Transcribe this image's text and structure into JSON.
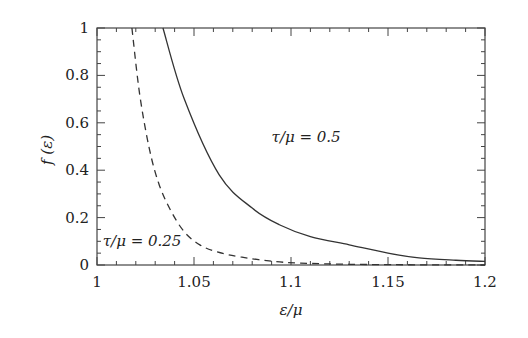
{
  "chart_data": {
    "type": "line",
    "title": "",
    "xlabel": "ε/μ",
    "ylabel": "f (ε)",
    "xlim": [
      1,
      1.2
    ],
    "ylim": [
      0,
      1
    ],
    "xticks": [
      1,
      1.05,
      1.1,
      1.15,
      1.2
    ],
    "xtick_labels": [
      "1",
      "1.05",
      "1.1",
      "1.15",
      "1.2"
    ],
    "yticks": [
      0,
      0.2,
      0.4,
      0.6,
      0.8,
      1
    ],
    "ytick_labels": [
      "0",
      "0.2",
      "0.4",
      "0.6",
      "0.8",
      "1"
    ],
    "grid": false,
    "legend": "none (inline annotations)",
    "series": [
      {
        "name": "τ/μ = 0.5",
        "style": "solid",
        "x": [
          1.034,
          1.045,
          1.063,
          1.08,
          1.094,
          1.11,
          1.13,
          1.15,
          1.166,
          1.185,
          1.2
        ],
        "y": [
          1.0,
          0.7,
          0.38,
          0.24,
          0.17,
          0.12,
          0.085,
          0.05,
          0.03,
          0.02,
          0.015
        ]
      },
      {
        "name": "τ/μ = 0.25",
        "style": "dashed",
        "x": [
          1.018,
          1.022,
          1.027,
          1.032,
          1.038,
          1.045,
          1.053,
          1.062,
          1.074,
          1.09,
          1.105,
          1.13,
          1.16,
          1.2
        ],
        "y": [
          1.0,
          0.72,
          0.49,
          0.34,
          0.23,
          0.14,
          0.085,
          0.055,
          0.034,
          0.016,
          0.008,
          0.003,
          0.001,
          0.0
        ]
      }
    ],
    "annotations": [
      {
        "text": "τ/μ = 0.5",
        "x": 1.09,
        "y": 0.52
      },
      {
        "text": "τ/μ = 0.25",
        "x": 1.003,
        "y": 0.08
      }
    ]
  }
}
